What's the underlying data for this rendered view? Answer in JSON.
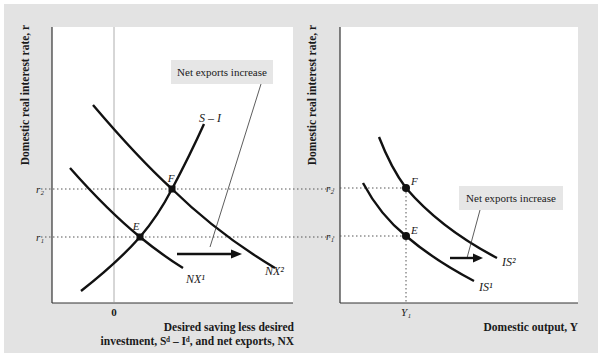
{
  "colors": {
    "background": "#e3e3e3",
    "panel": "#ffffff",
    "curve": "#111111",
    "callout_box": "#e6e6e6",
    "guide": "#666666"
  },
  "left_panel": {
    "y_axis_title": "Domestic real interest rate, r",
    "x_axis_title_line1": "Desired saving less desired",
    "x_axis_title_line2": "investment, Sᵈ – Iᵈ, and net exports, NX",
    "zero_label": "0",
    "r1_label": "r₁",
    "r2_label": "r₂",
    "point_e_label": "E",
    "point_f_label": "F",
    "curve_s_i_label": "S – I",
    "curve_nx1_label": "NX¹",
    "curve_nx2_label": "NX²",
    "callout": "Net exports increase"
  },
  "right_panel": {
    "y_axis_title": "Domestic real interest rate, r",
    "x_axis_title": "Domestic output, Y",
    "y1_label": "Y₁",
    "r1_label": "r₁",
    "r2_label": "r₂",
    "point_e_label": "E",
    "point_f_label": "F",
    "curve_is1_label": "IS¹",
    "curve_is2_label": "IS²",
    "callout": "Net exports increase"
  }
}
